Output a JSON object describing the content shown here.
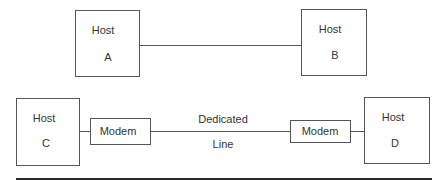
{
  "diagram": {
    "title": "",
    "top_row": {
      "host_a": {
        "label": "Host",
        "id": "A"
      },
      "host_b": {
        "label": "Host",
        "id": "B"
      },
      "connection": "direct"
    },
    "bottom_row": {
      "host_c": {
        "label": "Host",
        "id": "C"
      },
      "modem_c": {
        "label": "Modem"
      },
      "link": {
        "line1": "Dedicated",
        "line2": "Line"
      },
      "modem_d": {
        "label": "Modem"
      },
      "host_d": {
        "label": "Host",
        "id": "D"
      }
    },
    "colors": {
      "stroke": "#555555",
      "text": "#333333",
      "rule": "#2a2a2a"
    }
  }
}
